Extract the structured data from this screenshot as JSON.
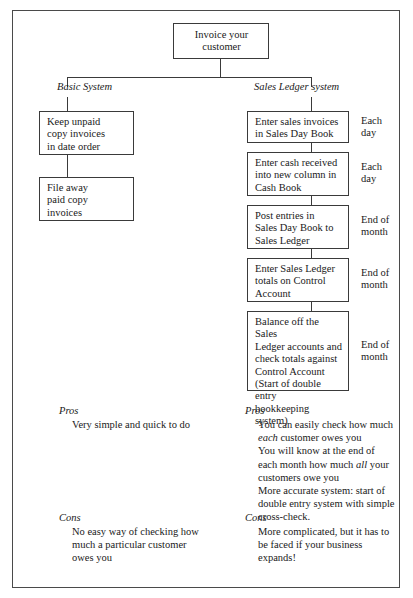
{
  "diagram": {
    "root": {
      "text": "Invoice your\ncustomer"
    },
    "branches": [
      {
        "title": "Basic System",
        "nodes": [
          {
            "text": "Keep unpaid\ncopy invoices\nin date order"
          },
          {
            "text": "File away\npaid copy\ninvoices"
          }
        ]
      },
      {
        "title": "Sales Ledger system",
        "nodes": [
          {
            "text": "Enter sales invoices\nin Sales Day Book",
            "side_label": "Each\nday"
          },
          {
            "text": "Enter cash received\ninto new column in\nCash Book",
            "side_label": "Each\nday"
          },
          {
            "text": "Post entries in\nSales Day Book to\nSales Ledger",
            "side_label": "End of\nmonth"
          },
          {
            "text": "Enter Sales Ledger\ntotals on Control\nAccount",
            "side_label": "End of\nmonth"
          },
          {
            "text": "Balance off the Sales\nLedger accounts and\ncheck totals against\nControl Account\n(Start of double entry\nbookkeeping system)",
            "side_label": "End of\nmonth"
          }
        ]
      }
    ]
  },
  "assessments": {
    "basic": {
      "pros_heading": "Pros",
      "pros_lines": [
        "Very simple and quick to do"
      ],
      "cons_heading": "Cons",
      "cons_lines": [
        "No easy way of checking how",
        "much a particular customer",
        "owes you"
      ]
    },
    "sales_ledger": {
      "pros_heading": "Pros",
      "pros_lines_html": [
        "You can easily check how much",
        "<em>each</em> customer owes you",
        "You will know at the end of",
        "each month how much <em>all</em> your",
        "customers owe you",
        "More accurate system: start of",
        "double entry system with simple",
        "cross-check."
      ],
      "cons_heading": "Cons",
      "cons_lines": [
        "More complicated, but it has to",
        "be faced if your business",
        "expands!"
      ]
    }
  }
}
